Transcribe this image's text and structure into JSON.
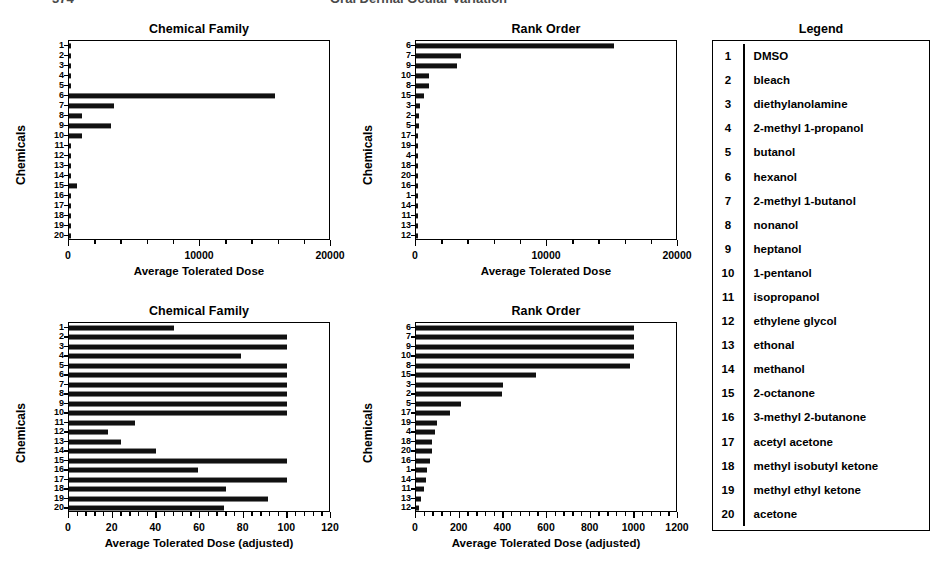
{
  "runhead": {
    "left": "374",
    "right": "Oral Dermal Ocular Variation"
  },
  "legend": {
    "title": "Legend",
    "items": [
      {
        "num": "1",
        "name": "DMSO"
      },
      {
        "num": "2",
        "name": "bleach"
      },
      {
        "num": "3",
        "name": "diethylanolamine"
      },
      {
        "num": "4",
        "name": "2-methyl 1-propanol"
      },
      {
        "num": "5",
        "name": "butanol"
      },
      {
        "num": "6",
        "name": "hexanol"
      },
      {
        "num": "7",
        "name": "2-methyl 1-butanol"
      },
      {
        "num": "8",
        "name": "nonanol"
      },
      {
        "num": "9",
        "name": "heptanol"
      },
      {
        "num": "10",
        "name": "1-pentanol"
      },
      {
        "num": "11",
        "name": "isopropanol"
      },
      {
        "num": "12",
        "name": "ethylene glycol"
      },
      {
        "num": "13",
        "name": "ethonal"
      },
      {
        "num": "14",
        "name": "methanol"
      },
      {
        "num": "15",
        "name": "2-octanone"
      },
      {
        "num": "16",
        "name": "3-methyl 2-butanone"
      },
      {
        "num": "17",
        "name": "acetyl acetone"
      },
      {
        "num": "18",
        "name": "methyl isobutyl ketone"
      },
      {
        "num": "19",
        "name": "methyl ethyl ketone"
      },
      {
        "num": "20",
        "name": "acetone"
      }
    ]
  },
  "chart_data": [
    {
      "id": "top-left",
      "type": "bar",
      "orientation": "horizontal",
      "title": "Chemical Family",
      "xlabel": "Average Tolerated Dose",
      "ylabel": "Chemicals",
      "xlim": [
        0,
        20000
      ],
      "xticks": [
        0,
        10000,
        20000
      ],
      "xticklabels": [
        "0",
        "10000",
        "20000"
      ],
      "grid": false,
      "legend": "none",
      "categories": [
        "1",
        "2",
        "3",
        "4",
        "5",
        "6",
        "7",
        "8",
        "9",
        "10",
        "11",
        "12",
        "13",
        "14",
        "15",
        "16",
        "17",
        "18",
        "19",
        "20"
      ],
      "values": [
        60,
        90,
        70,
        60,
        80,
        15700,
        3400,
        1000,
        3200,
        1000,
        60,
        60,
        60,
        90,
        600,
        70,
        60,
        60,
        60,
        60
      ]
    },
    {
      "id": "top-right",
      "type": "bar",
      "orientation": "horizontal",
      "title": "Rank Order",
      "xlabel": "Average Tolerated Dose",
      "ylabel": "Chemicals",
      "xlim": [
        0,
        20000
      ],
      "xticks": [
        0,
        10000,
        20000
      ],
      "xticklabels": [
        "0",
        "10000",
        "20000"
      ],
      "grid": false,
      "legend": "none",
      "categories": [
        "6",
        "7",
        "9",
        "10",
        "8",
        "15",
        "3",
        "2",
        "5",
        "17",
        "19",
        "4",
        "18",
        "20",
        "16",
        "1",
        "14",
        "11",
        "13",
        "12"
      ],
      "values": [
        15100,
        3400,
        3150,
        1000,
        1000,
        600,
        300,
        260,
        230,
        180,
        150,
        130,
        120,
        110,
        100,
        90,
        85,
        75,
        65,
        50
      ]
    },
    {
      "id": "bottom-left",
      "type": "bar",
      "orientation": "horizontal",
      "title": "Chemical Family",
      "xlabel": "Average Tolerated Dose (adjusted)",
      "ylabel": "Chemicals",
      "xlim": [
        0,
        120
      ],
      "xticks": [
        0,
        20,
        40,
        60,
        80,
        100,
        120
      ],
      "xticklabels": [
        "0",
        "20",
        "40",
        "60",
        "80",
        "100",
        "120"
      ],
      "grid": false,
      "legend": "none",
      "categories": [
        "1",
        "2",
        "3",
        "4",
        "5",
        "6",
        "7",
        "8",
        "9",
        "10",
        "11",
        "12",
        "13",
        "14",
        "15",
        "16",
        "17",
        "18",
        "19",
        "20"
      ],
      "values": [
        48,
        100,
        100,
        79,
        100,
        100,
        100,
        100,
        100,
        100,
        30,
        18,
        24,
        40,
        100,
        59,
        100,
        72,
        91,
        71
      ]
    },
    {
      "id": "bottom-right",
      "type": "bar",
      "orientation": "horizontal",
      "title": "Rank Order",
      "xlabel": "Average Tolerated Dose (adjusted)",
      "ylabel": "Chemicals",
      "xlim": [
        0,
        1200
      ],
      "xticks": [
        0,
        200,
        400,
        600,
        800,
        1000,
        1200
      ],
      "xticklabels": [
        "0",
        "200",
        "400",
        "600",
        "800",
        "1000",
        "1200"
      ],
      "grid": false,
      "legend": "none",
      "categories": [
        "6",
        "7",
        "9",
        "10",
        "8",
        "15",
        "3",
        "2",
        "5",
        "17",
        "19",
        "4",
        "18",
        "20",
        "16",
        "1",
        "14",
        "11",
        "13",
        "12"
      ],
      "values": [
        1000,
        1000,
        1000,
        1000,
        980,
        550,
        400,
        395,
        205,
        155,
        95,
        85,
        75,
        75,
        65,
        50,
        45,
        35,
        25,
        15
      ]
    }
  ]
}
